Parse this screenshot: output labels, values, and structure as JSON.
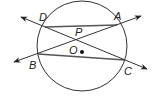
{
  "diagram": {
    "type": "circle-geometry",
    "circle": {
      "center": [
        82,
        46
      ],
      "radius": 45,
      "center_label": "O"
    },
    "points": {
      "D": {
        "label": "D",
        "x": 45,
        "y": 27
      },
      "A": {
        "label": "A",
        "x": 117,
        "y": 25
      },
      "B": {
        "label": "B",
        "x": 38,
        "y": 54
      },
      "C": {
        "label": "C",
        "x": 125,
        "y": 60
      },
      "P": {
        "label": "P",
        "x": 76,
        "y": 40
      },
      "O": {
        "label": "O",
        "x": 81,
        "y": 51
      }
    },
    "segments": [
      "DA",
      "BC"
    ],
    "lines": [
      "DC (secant line with arrows)",
      "BA (secant line with arrows)"
    ],
    "labels": {
      "D": "D",
      "A": "A",
      "B": "B",
      "C": "C",
      "P": "P",
      "O": "O"
    },
    "colors": {
      "stroke": "#333333",
      "chord": "#555555",
      "background": "#ffffff"
    }
  }
}
